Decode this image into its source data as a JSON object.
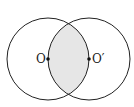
{
  "diagram": {
    "points": [
      {
        "id": "O",
        "label": "O"
      },
      {
        "id": "O-prime",
        "label": "O′"
      }
    ],
    "colors": {
      "stroke": "#222222",
      "shade": "#e6e6e6",
      "background": "#ffffff"
    }
  }
}
